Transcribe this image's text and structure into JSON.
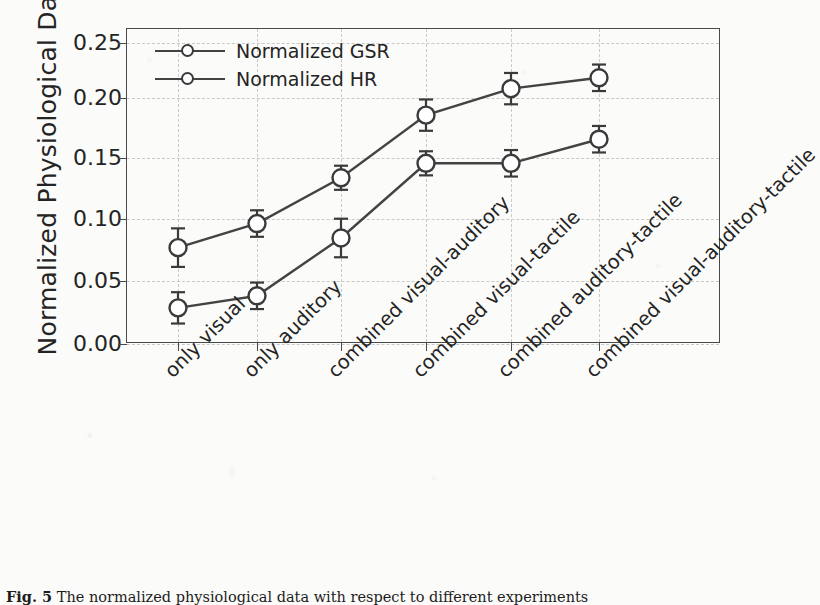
{
  "chart_data": {
    "type": "line",
    "title": "",
    "xlabel": "",
    "ylabel": "Normalized Physiological Data",
    "ylim": [
      0.0,
      0.2615
    ],
    "yticks": [
      "0.00",
      "0.05",
      "0.10",
      "0.15",
      "0.20",
      "0.25"
    ],
    "ytick_values": [
      0.0,
      0.05,
      0.1,
      0.15,
      0.2,
      0.25
    ],
    "grid": true,
    "legend_position": "top-left",
    "categories": [
      "only visual",
      "only auditory",
      "combined visual-auditory",
      "combined visual-tactile",
      "combined auditory-tactile",
      "combined visual-auditory-tactile"
    ],
    "series": [
      {
        "name": "Normalized GSR",
        "values": [
          0.08,
          0.1,
          0.138,
          0.19,
          0.212,
          0.221
        ],
        "errors": [
          0.016,
          0.011,
          0.01,
          0.013,
          0.013,
          0.011
        ],
        "marker": "open-circle",
        "color": "#434343"
      },
      {
        "name": "Normalized HR",
        "values": [
          0.03,
          0.04,
          0.088,
          0.15,
          0.15,
          0.17
        ],
        "errors": [
          0.013,
          0.011,
          0.016,
          0.01,
          0.011,
          0.011
        ],
        "marker": "open-circle",
        "color": "#434343"
      }
    ]
  },
  "legend": {
    "items": [
      {
        "label": "Normalized GSR"
      },
      {
        "label": "Normalized HR"
      }
    ]
  },
  "caption": {
    "figure_number": "Fig. 5",
    "text": "The normalized physiological data with respect to different experiments"
  }
}
